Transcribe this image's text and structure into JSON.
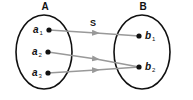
{
  "diagram": {
    "type": "set-mapping",
    "mapping_label": "S",
    "colors": {
      "outline": "#111111",
      "arrow": "#999999",
      "dot": "#111111"
    },
    "sets": [
      {
        "label": "A",
        "elements": [
          {
            "base": "a",
            "sub": "1"
          },
          {
            "base": "a",
            "sub": "2"
          },
          {
            "base": "a",
            "sub": "3"
          }
        ]
      },
      {
        "label": "B",
        "elements": [
          {
            "base": "b",
            "sub": "1"
          },
          {
            "base": "b",
            "sub": "2"
          }
        ]
      }
    ],
    "arrows": [
      {
        "from": "a1",
        "to": "b1"
      },
      {
        "from": "a2",
        "to": "b2"
      },
      {
        "from": "a3",
        "to": "b2"
      }
    ]
  }
}
